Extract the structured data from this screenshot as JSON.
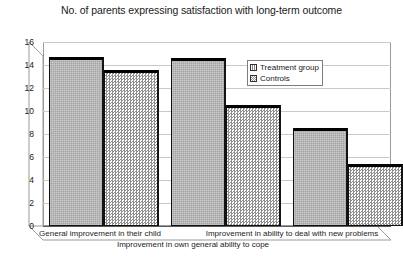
{
  "chart_data": {
    "type": "bar",
    "title": "No. of parents expressing satisfaction with long-term outcome",
    "xlabel": "",
    "ylabel": "",
    "ylim": [
      0,
      16
    ],
    "ytick_step": 2,
    "yticks": [
      "16",
      "14",
      "12",
      "10",
      "8",
      "6",
      "4",
      "2",
      "0"
    ],
    "grid": true,
    "legend_position": "inside-top-right",
    "categories": [
      "General improvement in their child",
      "Improvement in own general ability to cope",
      "Improvement in ability to deal with new problems"
    ],
    "series": [
      {
        "name": "Treatment group",
        "values": [
          14.7,
          14.6,
          8.5
        ],
        "color": "#b4b4b4",
        "pattern": "solid-gray"
      },
      {
        "name": "Controls",
        "values": [
          13.6,
          10.5,
          5.4
        ],
        "color": "#ffffff",
        "pattern": "checkerboard"
      }
    ]
  },
  "legend": {
    "entries": [
      {
        "label": "Treatment group"
      },
      {
        "label": "Controls"
      }
    ]
  }
}
